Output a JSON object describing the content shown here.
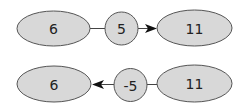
{
  "diagrams": [
    {
      "name": "forward",
      "nodes": [
        {
          "id": "a",
          "label": "6",
          "shape": "ellipse"
        },
        {
          "id": "op",
          "label": "5",
          "shape": "circle"
        },
        {
          "id": "b",
          "label": "11",
          "shape": "ellipse"
        }
      ],
      "edges": [
        {
          "from": "a",
          "to": "op",
          "arrow": false
        },
        {
          "from": "op",
          "to": "b",
          "arrow": true
        }
      ]
    },
    {
      "name": "backward",
      "nodes": [
        {
          "id": "a",
          "label": "6",
          "shape": "ellipse"
        },
        {
          "id": "op",
          "label": "-5",
          "shape": "circle"
        },
        {
          "id": "b",
          "label": "11",
          "shape": "ellipse"
        }
      ],
      "edges": [
        {
          "from": "b",
          "to": "op",
          "arrow": false
        },
        {
          "from": "op",
          "to": "a",
          "arrow": true
        }
      ]
    }
  ],
  "colors": {
    "node_fill": "#d8d8d8",
    "stroke": "#555555",
    "text": "#222222"
  }
}
